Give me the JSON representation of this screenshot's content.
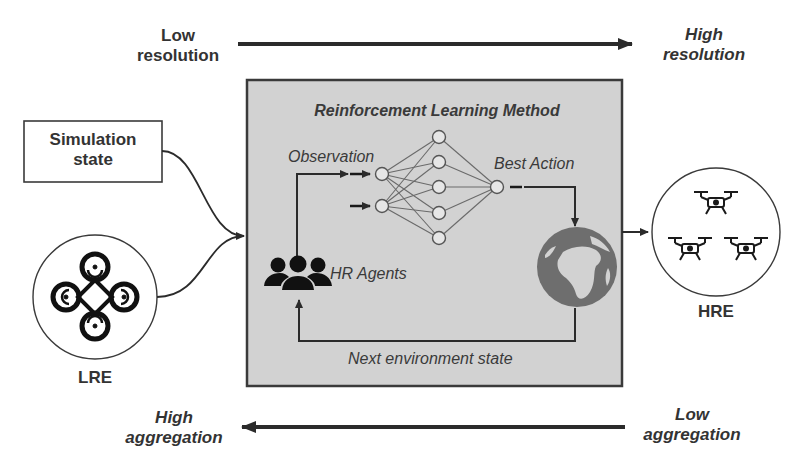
{
  "axis_top": {
    "left_label_line1": "Low",
    "left_label_line2": "resolution",
    "right_label_line1": "High",
    "right_label_line2": "resolution"
  },
  "axis_bottom": {
    "left_label_line1": "High",
    "left_label_line2": "aggregation",
    "right_label_line1": "Low",
    "right_label_line2": "aggregation"
  },
  "simulation_state": {
    "line1": "Simulation",
    "line2": "state"
  },
  "lre": {
    "label": "LRE",
    "icon": "quadcopter-top-view-icon"
  },
  "hre": {
    "label": "HRE",
    "icons": [
      "drone-icon",
      "drone-icon",
      "drone-icon"
    ]
  },
  "rl_box": {
    "title": "Reinforcement Learning Method",
    "observation_label": "Observation",
    "best_action_label": "Best Action",
    "agents_label": "HR Agents",
    "next_state_label": "Next environment state",
    "neural_network": {
      "input_nodes": 2,
      "hidden_nodes": 5,
      "output_nodes": 1
    },
    "environment_icon": "globe-icon",
    "agents_icon": "group-users-icon"
  },
  "colors": {
    "box_fill": "#d2d2d2",
    "box_border": "#3a3a3a",
    "line": "#2b2b2b",
    "globe": "#6e6e6e",
    "text": "#333333"
  }
}
